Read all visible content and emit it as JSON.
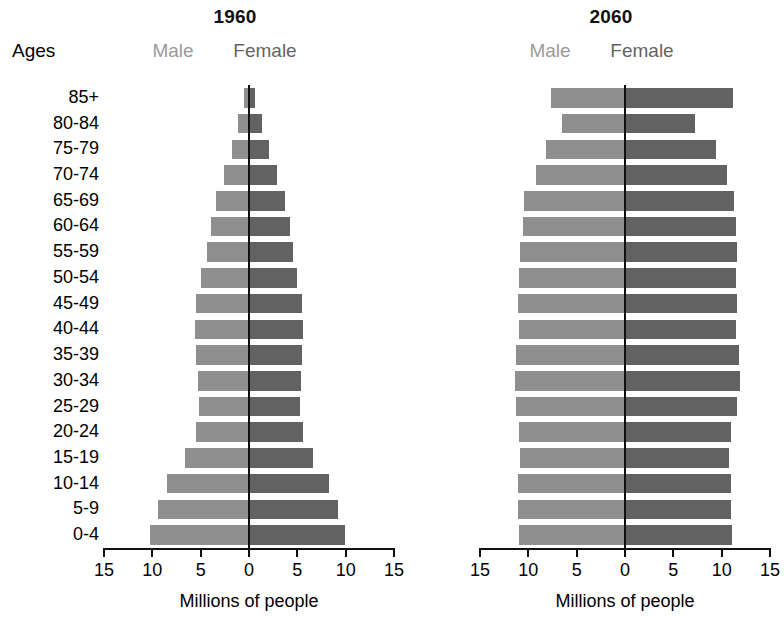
{
  "ages_header": "Ages",
  "panels": [
    {
      "id": "1960",
      "title": "1960",
      "legend_male": "Male",
      "legend_female": "Female",
      "axis_title": "Millions of people"
    },
    {
      "id": "2060",
      "title": "2060",
      "legend_male": "Male",
      "legend_female": "Female",
      "axis_title": "Millions of people"
    }
  ],
  "axis": {
    "tick_labels": [
      "15",
      "10",
      "5",
      "0",
      "5",
      "10",
      "15"
    ],
    "tick_values": [
      -15,
      -10,
      -5,
      0,
      5,
      10,
      15
    ],
    "title": "Millions of people"
  },
  "colors": {
    "male": "#8f8f8f",
    "female": "#626262",
    "male_text": "#9a9a9a",
    "female_text": "#646464",
    "axis": "#111111",
    "background": "#ffffff"
  },
  "chart_data": {
    "type": "bar",
    "subtitle": "",
    "xlabel": "Millions of people",
    "ylabel": "Ages",
    "xlim": [
      -15,
      15
    ],
    "xticks": [
      -15,
      -10,
      -5,
      0,
      5,
      10,
      15
    ],
    "xticklabels": [
      "15",
      "10",
      "5",
      "0",
      "5",
      "10",
      "15"
    ],
    "grid": false,
    "legend_position": "top-center",
    "orientation": "horizontal-diverging",
    "categories": [
      "85+",
      "80-84",
      "75-79",
      "70-74",
      "65-69",
      "60-64",
      "55-59",
      "50-54",
      "45-49",
      "40-44",
      "35-39",
      "30-34",
      "25-29",
      "20-24",
      "15-19",
      "10-14",
      "5-9",
      "0-4"
    ],
    "panels": [
      {
        "name": "1960",
        "series": [
          {
            "name": "Male",
            "values": [
              0.5,
              1.1,
              1.8,
              2.6,
              3.4,
              3.9,
              4.3,
              5.0,
              5.5,
              5.6,
              5.5,
              5.3,
              5.2,
              5.5,
              6.6,
              8.5,
              9.4,
              10.2
            ]
          },
          {
            "name": "Female",
            "values": [
              0.6,
              1.3,
              2.1,
              2.9,
              3.7,
              4.2,
              4.5,
              5.0,
              5.5,
              5.6,
              5.5,
              5.4,
              5.3,
              5.6,
              6.6,
              8.3,
              9.2,
              9.9
            ]
          }
        ]
      },
      {
        "name": "2060",
        "series": [
          {
            "name": "Male",
            "values": [
              7.7,
              6.5,
              8.2,
              9.2,
              10.4,
              10.6,
              10.9,
              11.0,
              11.1,
              11.0,
              11.3,
              11.4,
              11.3,
              11.0,
              10.9,
              11.1,
              11.1,
              11.0
            ]
          },
          {
            "name": "Female",
            "values": [
              11.2,
              7.2,
              9.4,
              10.6,
              11.3,
              11.5,
              11.6,
              11.5,
              11.6,
              11.5,
              11.8,
              11.9,
              11.6,
              11.0,
              10.8,
              11.0,
              11.0,
              11.1
            ]
          }
        ]
      }
    ]
  }
}
